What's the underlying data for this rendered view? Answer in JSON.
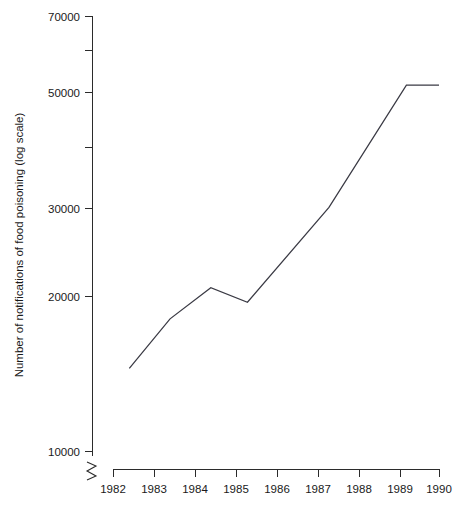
{
  "chart_data": {
    "type": "line",
    "title": "",
    "xlabel": "",
    "ylabel": "Number of notifications of food poisoning (log scale)",
    "grid": false,
    "legend": false,
    "yscale": "log",
    "axis_break": true,
    "xlim": [
      1982,
      1990
    ],
    "ylim": [
      10000,
      70000
    ],
    "x_ticks": [
      1982,
      1983,
      1984,
      1985,
      1986,
      1987,
      1988,
      1989,
      1990
    ],
    "x_tick_labels": [
      "1982",
      "1983",
      "1984",
      "1985",
      "1986",
      "1987",
      "1988",
      "1989",
      "1990"
    ],
    "y_ticks_major": [
      10000,
      20000,
      30000,
      50000,
      70000
    ],
    "y_tick_labels": [
      "10000",
      "20000",
      "30000",
      "50000",
      "70000"
    ],
    "y_ticks_minor": [
      40000,
      60000
    ],
    "series": [
      {
        "name": "Notifications of food poisoning",
        "x": [
          1982.4,
          1983.4,
          1984.4,
          1985.3,
          1987.3,
          1989.2,
          1990.0
        ],
        "values": [
          14500,
          18100,
          20800,
          19500,
          29800,
          51500,
          51500
        ]
      }
    ]
  },
  "axis": {
    "y_label_text": "Number of notifications of food poisoning (log scale)",
    "break_symbol": "axis-break-zigzag"
  }
}
